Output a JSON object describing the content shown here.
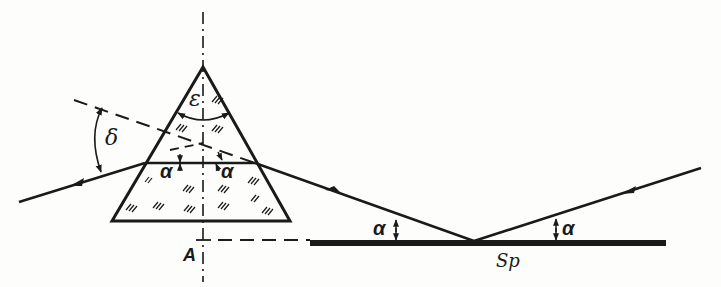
{
  "diagram": {
    "type": "optics-schematic",
    "colors": {
      "ink": "#1a1a1a",
      "background": "#fdfdfc"
    },
    "labels": {
      "epsilon": "ε",
      "delta": "δ",
      "alpha_left_inside": "α",
      "alpha_right_inside": "α",
      "alpha_mirror_left": "α",
      "alpha_mirror_right": "α",
      "point_a": "A",
      "mirror": "Sp"
    },
    "elements": [
      {
        "name": "prism",
        "shape": "triangle/trapezoid with glass hatching"
      },
      {
        "name": "optical-axis",
        "style": "dash-dot vertical"
      },
      {
        "name": "mirror",
        "label": "Sp"
      },
      {
        "name": "incident-ray",
        "direction": "from upper right toward mirror"
      },
      {
        "name": "reflected-ray",
        "direction": "from mirror to prism"
      },
      {
        "name": "exit-ray",
        "direction": "out of prism to the left"
      },
      {
        "name": "extension-line",
        "style": "dashed"
      },
      {
        "name": "reference-line",
        "style": "dashed horizontal from A"
      }
    ]
  }
}
